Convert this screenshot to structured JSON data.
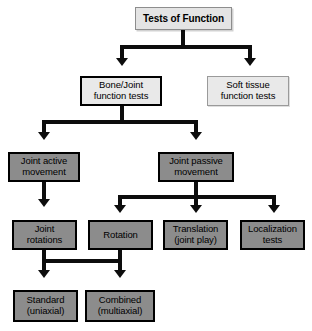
{
  "diagram": {
    "title": "Tests of Function",
    "type": "flowchart",
    "nodes": [
      {
        "id": "root",
        "label": "Tests of Function",
        "lines": [
          "Tests of Function"
        ]
      },
      {
        "id": "bone_joint",
        "label": "Bone/Joint function tests",
        "lines": [
          "Bone/Joint",
          "function tests"
        ]
      },
      {
        "id": "soft_tissue",
        "label": "Soft tissue function tests",
        "lines": [
          "Soft tissue",
          "function tests"
        ]
      },
      {
        "id": "active",
        "label": "Joint active movement",
        "lines": [
          "Joint active",
          "movement"
        ]
      },
      {
        "id": "passive",
        "label": "Joint passive movement",
        "lines": [
          "Joint passive",
          "movement"
        ]
      },
      {
        "id": "joint_rot",
        "label": "Joint rotations",
        "lines": [
          "Joint",
          "rotations"
        ]
      },
      {
        "id": "rotation",
        "label": "Rotation",
        "lines": [
          "Rotation"
        ]
      },
      {
        "id": "translation",
        "label": "Translation (joint play)",
        "lines": [
          "Translation",
          "(joint play)"
        ]
      },
      {
        "id": "localization",
        "label": "Localization tests",
        "lines": [
          "Localization",
          "tests"
        ]
      },
      {
        "id": "standard",
        "label": "Standard (uniaxial)",
        "lines": [
          "Standard",
          "(uniaxial)"
        ]
      },
      {
        "id": "combined",
        "label": "Combined (multiaxial)",
        "lines": [
          "Combined",
          "(multiaxial)"
        ]
      }
    ],
    "edges": [
      {
        "from": "root",
        "to": "bone_joint"
      },
      {
        "from": "root",
        "to": "soft_tissue"
      },
      {
        "from": "bone_joint",
        "to": "active"
      },
      {
        "from": "bone_joint",
        "to": "passive"
      },
      {
        "from": "active",
        "to": "joint_rot"
      },
      {
        "from": "passive",
        "to": "rotation"
      },
      {
        "from": "passive",
        "to": "translation"
      },
      {
        "from": "passive",
        "to": "localization"
      },
      {
        "from": "joint_rot",
        "to": "standard"
      },
      {
        "from": "joint_rot",
        "to": "combined"
      },
      {
        "from": "rotation",
        "to": "standard"
      },
      {
        "from": "rotation",
        "to": "combined"
      }
    ],
    "colors": {
      "fill_grey": "#8c8c8c",
      "fill_light": "#e9e9e9",
      "border_dark": "#000000",
      "border_light": "#9a9a9a",
      "connector": "#0d0d0d",
      "background": "#ffffff"
    }
  }
}
